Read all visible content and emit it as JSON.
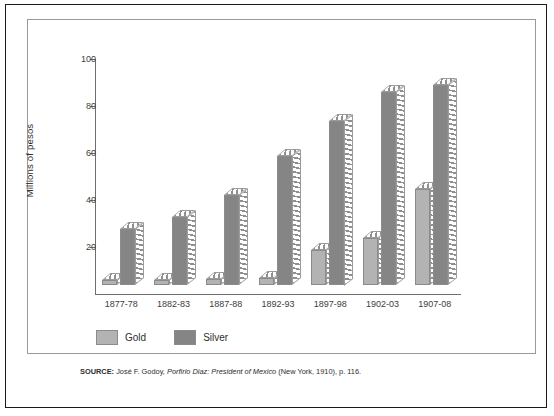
{
  "chart_data": {
    "type": "bar",
    "title": "",
    "subtitle": "",
    "xlabel": "",
    "ylabel": "Millions of pesos",
    "ylim": [
      0,
      100
    ],
    "yticks": [
      0,
      20,
      40,
      60,
      80,
      100
    ],
    "ytick_labels": [
      "",
      "20",
      "40",
      "60",
      "80",
      "100"
    ],
    "grid": false,
    "legend_position": "below-axis-left",
    "categories": [
      "1877-78",
      "1882-83",
      "1887-88",
      "1892-93",
      "1897-98",
      "1902-03",
      "1907-08"
    ],
    "series": [
      {
        "name": "Gold",
        "color": "#b3b3b3",
        "values": [
          2,
          2,
          2.5,
          3,
          15,
          20,
          41
        ]
      },
      {
        "name": "Silver",
        "color": "#858585",
        "values": [
          24,
          29,
          38.5,
          55,
          70,
          82,
          85
        ]
      }
    ],
    "annotations": []
  },
  "legend": {
    "items": [
      {
        "label": "Gold",
        "swatch": "gold"
      },
      {
        "label": "Silver",
        "swatch": "silver"
      }
    ]
  },
  "source": {
    "label": "SOURCE:",
    "author": "José F. Godoy,",
    "work": "Porfirio Diaz: President of Mexico",
    "publication": "(New York, 1910), p. 116."
  },
  "colors": {
    "gold": "#b3b3b3",
    "silver": "#858585",
    "axis": "#6e6e6e",
    "outer_border": "#1a1a1a",
    "panel_border": "#9a9a9a"
  }
}
